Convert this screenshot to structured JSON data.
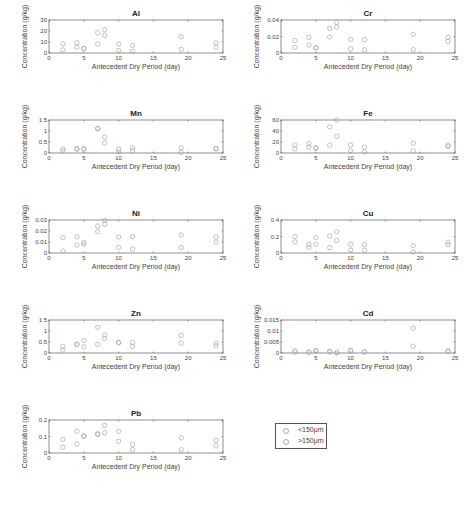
{
  "figure": {
    "xlabel": "Antecedent Dry Period (day)",
    "ylabel": "Concentration (g/kg)",
    "marker_color": "#a8a8a8",
    "axis_color": "#444444"
  },
  "legend": {
    "items": [
      {
        "label": "<150μm"
      },
      {
        "label": ">150μm"
      }
    ]
  },
  "chart_data": [
    {
      "type": "scatter",
      "title": "Al",
      "xlabel": "Antecedent Dry Period (day)",
      "ylabel": "Concentration (g/kg)",
      "xlim": [
        0,
        25
      ],
      "ylim": [
        0,
        30
      ],
      "xticks": [
        0,
        5,
        10,
        15,
        20,
        25
      ],
      "yticks": [
        0,
        10,
        20,
        30
      ],
      "ytick_labels": [
        "0",
        "10",
        "20",
        "30"
      ],
      "series": [
        {
          "name": "<150μm",
          "x": [
            2,
            4,
            5,
            7,
            8,
            10,
            12,
            19,
            24
          ],
          "y": [
            8.3,
            9.3,
            4.2,
            18.5,
            21.2,
            8.3,
            7.0,
            14.8,
            9.2
          ]
        },
        {
          "name": ">150μm",
          "x": [
            2,
            4,
            5,
            7,
            8,
            10,
            12,
            19,
            24
          ],
          "y": [
            2.8,
            5.5,
            4.0,
            8.3,
            16.0,
            2.2,
            1.5,
            3.2,
            5.3
          ]
        }
      ]
    },
    {
      "type": "scatter",
      "title": "Cr",
      "xlabel": "Antecedent Dry Period (day)",
      "ylabel": "Concentration (g/kg)",
      "xlim": [
        0,
        25
      ],
      "ylim": [
        0,
        0.04
      ],
      "xticks": [
        0,
        5,
        10,
        15,
        20,
        25
      ],
      "yticks": [
        0,
        0.02,
        0.04
      ],
      "ytick_labels": [
        "0",
        "0.02",
        "0.04"
      ],
      "series": [
        {
          "name": "<150μm",
          "x": [
            2,
            4,
            5,
            7,
            8,
            10,
            12,
            19,
            24
          ],
          "y": [
            0.015,
            0.019,
            0.0065,
            0.03,
            0.037,
            0.0165,
            0.0162,
            0.0225,
            0.019
          ]
        },
        {
          "name": ">150μm",
          "x": [
            2,
            4,
            5,
            7,
            8,
            10,
            12,
            19,
            24
          ],
          "y": [
            0.0068,
            0.0098,
            0.0062,
            0.0195,
            0.0315,
            0.005,
            0.0038,
            0.004,
            0.014
          ]
        }
      ]
    },
    {
      "type": "scatter",
      "title": "Mn",
      "xlabel": "Antecedent Dry Period (day)",
      "ylabel": "Concentration (g/kg)",
      "xlim": [
        0,
        25
      ],
      "ylim": [
        0,
        1.5
      ],
      "xticks": [
        0,
        5,
        10,
        15,
        20,
        25
      ],
      "yticks": [
        0,
        0.5,
        1,
        1.5
      ],
      "ytick_labels": [
        "0",
        "0.5",
        "1",
        "1.5"
      ],
      "series": [
        {
          "name": "<150μm",
          "x": [
            2,
            4,
            5,
            7,
            8,
            10,
            12,
            19,
            24
          ],
          "y": [
            0.18,
            0.21,
            0.21,
            1.12,
            0.72,
            0.18,
            0.23,
            0.24,
            0.21
          ]
        },
        {
          "name": ">150μm",
          "x": [
            2,
            4,
            5,
            7,
            8,
            10,
            12,
            19,
            24
          ],
          "y": [
            0.1,
            0.17,
            0.17,
            1.1,
            0.45,
            0.05,
            0.1,
            0.03,
            0.19
          ]
        }
      ]
    },
    {
      "type": "scatter",
      "title": "Fe",
      "xlabel": "Antecedent Dry Period (day)",
      "ylabel": "Concentration (g/kg)",
      "xlim": [
        0,
        25
      ],
      "ylim": [
        0,
        60
      ],
      "xticks": [
        0,
        5,
        10,
        15,
        20,
        25
      ],
      "yticks": [
        0,
        20,
        40,
        60
      ],
      "ytick_labels": [
        "0",
        "20",
        "40",
        "60"
      ],
      "series": [
        {
          "name": "<150μm",
          "x": [
            2,
            4,
            5,
            7,
            8,
            10,
            12,
            19,
            24
          ],
          "y": [
            14.5,
            17.0,
            9.5,
            47.5,
            60.0,
            14.5,
            10.5,
            18.0,
            14.0
          ]
        },
        {
          "name": ">150μm",
          "x": [
            2,
            4,
            5,
            7,
            8,
            10,
            12,
            19,
            24
          ],
          "y": [
            7.5,
            10.5,
            8.5,
            14.5,
            30.5,
            4.0,
            2.0,
            4.0,
            12.0
          ]
        }
      ]
    },
    {
      "type": "scatter",
      "title": "Ni",
      "xlabel": "Antecedent Dry Period (day)",
      "ylabel": "Concentration (g/kg)",
      "xlim": [
        0,
        25
      ],
      "ylim": [
        0,
        0.03
      ],
      "xticks": [
        0,
        5,
        10,
        15,
        20,
        25
      ],
      "yticks": [
        0,
        0.01,
        0.02,
        0.03
      ],
      "ytick_labels": [
        "0",
        "0.01",
        "0.02",
        "0.03"
      ],
      "series": [
        {
          "name": "<150μm",
          "x": [
            2,
            4,
            5,
            7,
            8,
            10,
            12,
            19,
            24
          ],
          "y": [
            0.014,
            0.0148,
            0.0095,
            0.0245,
            0.0295,
            0.0145,
            0.0148,
            0.0165,
            0.0145
          ]
        },
        {
          "name": ">150μm",
          "x": [
            2,
            4,
            5,
            7,
            8,
            10,
            12,
            19,
            24
          ],
          "y": [
            0.0018,
            0.0072,
            0.008,
            0.0195,
            0.0262,
            0.0052,
            0.0035,
            0.005,
            0.01
          ]
        }
      ]
    },
    {
      "type": "scatter",
      "title": "Cu",
      "xlabel": "Antecedent Dry Period (day)",
      "ylabel": "Concentration (g/kg)",
      "xlim": [
        0,
        25
      ],
      "ylim": [
        0,
        0.4
      ],
      "xticks": [
        0,
        5,
        10,
        15,
        20,
        25
      ],
      "yticks": [
        0,
        0.2,
        0.4
      ],
      "ytick_labels": [
        "0",
        "0.2",
        "0.4"
      ],
      "series": [
        {
          "name": "<150μm",
          "x": [
            2,
            4,
            5,
            7,
            8,
            10,
            12,
            19,
            24
          ],
          "y": [
            0.2,
            0.105,
            0.185,
            0.205,
            0.255,
            0.105,
            0.1,
            0.09,
            0.13
          ]
        },
        {
          "name": ">150μm",
          "x": [
            2,
            4,
            5,
            7,
            8,
            10,
            12,
            19,
            24
          ],
          "y": [
            0.135,
            0.07,
            0.105,
            0.065,
            0.15,
            0.035,
            0.032,
            0.012,
            0.1
          ]
        }
      ]
    },
    {
      "type": "scatter",
      "title": "Zn",
      "xlabel": "Antecedent Dry Period (day)",
      "ylabel": "Concentration (g/kg)",
      "xlim": [
        0,
        25
      ],
      "ylim": [
        0,
        1.5
      ],
      "xticks": [
        0,
        5,
        10,
        15,
        20,
        25
      ],
      "yticks": [
        0,
        0.5,
        1,
        1.5
      ],
      "ytick_labels": [
        "0",
        "0.5",
        "1",
        "1.5"
      ],
      "series": [
        {
          "name": "<150μm",
          "x": [
            2,
            4,
            5,
            7,
            8,
            10,
            12,
            19,
            24
          ],
          "y": [
            0.3,
            0.4,
            0.57,
            1.17,
            0.82,
            0.48,
            0.48,
            0.8,
            0.45
          ]
        },
        {
          "name": ">150μm",
          "x": [
            2,
            4,
            5,
            7,
            8,
            10,
            12,
            19,
            24
          ],
          "y": [
            0.14,
            0.38,
            0.28,
            0.4,
            0.66,
            0.47,
            0.3,
            0.45,
            0.33
          ]
        }
      ]
    },
    {
      "type": "scatter",
      "title": "Cd",
      "xlabel": "Antecedent Dry Period (day)",
      "ylabel": "Concentration (g/kg)",
      "xlim": [
        0,
        25
      ],
      "ylim": [
        0,
        0.015
      ],
      "xticks": [
        0,
        5,
        10,
        15,
        20,
        25
      ],
      "yticks": [
        0,
        0.005,
        0.01,
        0.015
      ],
      "ytick_labels": [
        "0",
        "0.005",
        "0.01",
        "0.015"
      ],
      "series": [
        {
          "name": "<150μm",
          "x": [
            2,
            4,
            5,
            7,
            8,
            10,
            12,
            19,
            24
          ],
          "y": [
            0.001,
            0.0004,
            0.0012,
            0.0008,
            0.0002,
            0.0013,
            0.0006,
            0.0113,
            0.001
          ]
        },
        {
          "name": ">150μm",
          "x": [
            2,
            4,
            5,
            7,
            8,
            10,
            12,
            19,
            24
          ],
          "y": [
            0.0004,
            0.0003,
            0.0008,
            0.0005,
            0.0001,
            0.0008,
            0.0004,
            0.0031,
            0.0006
          ]
        }
      ]
    },
    {
      "type": "scatter",
      "title": "Pb",
      "xlabel": "Antecedent Dry Period (day)",
      "ylabel": "Concentration (g/kg)",
      "xlim": [
        0,
        25
      ],
      "ylim": [
        0,
        0.2
      ],
      "xticks": [
        0,
        5,
        10,
        15,
        20,
        25
      ],
      "yticks": [
        0,
        0.1,
        0.2
      ],
      "ytick_labels": [
        "0",
        "0.1",
        "0.2"
      ],
      "series": [
        {
          "name": "<150μm",
          "x": [
            2,
            4,
            5,
            7,
            8,
            10,
            12,
            19,
            24
          ],
          "y": [
            0.083,
            0.132,
            0.103,
            0.117,
            0.167,
            0.132,
            0.053,
            0.092,
            0.077
          ]
        },
        {
          "name": ">150μm",
          "x": [
            2,
            4,
            5,
            7,
            8,
            10,
            12,
            19,
            24
          ],
          "y": [
            0.034,
            0.055,
            0.101,
            0.112,
            0.122,
            0.071,
            0.021,
            0.02,
            0.043
          ]
        }
      ]
    }
  ],
  "layout": {
    "panels": [
      {
        "left": 0,
        "top": 0
      },
      {
        "left": 232,
        "top": 0
      },
      {
        "left": 0,
        "top": 100
      },
      {
        "left": 232,
        "top": 100
      },
      {
        "left": 0,
        "top": 200
      },
      {
        "left": 232,
        "top": 200
      },
      {
        "left": 0,
        "top": 300
      },
      {
        "left": 232,
        "top": 300
      },
      {
        "left": 0,
        "top": 400
      }
    ]
  }
}
